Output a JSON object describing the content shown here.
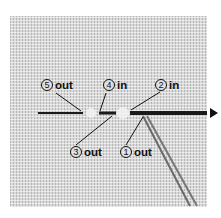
{
  "diagram": {
    "type": "backstitch-sequence",
    "colors": {
      "fabric": "#d9d9d9",
      "thread": "#1a1a1a",
      "thread_strands": "#6a6a6a",
      "label_text": "#111111"
    },
    "labels": [
      {
        "number": "5",
        "word": "out"
      },
      {
        "number": "4",
        "word": "in"
      },
      {
        "number": "2",
        "word": "in"
      },
      {
        "number": "3",
        "word": "out"
      },
      {
        "number": "1",
        "word": "out"
      }
    ],
    "arrow_icon": "triangle-right-icon"
  }
}
